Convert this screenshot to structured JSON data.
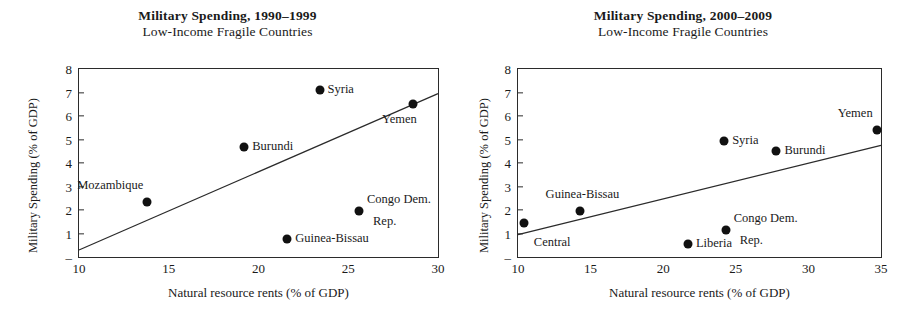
{
  "figure": {
    "panels": [
      "left",
      "right"
    ]
  },
  "chart_data": [
    {
      "id": "military-spending-1990-1999",
      "type": "scatter",
      "title": "Military Spending, 1990–1999",
      "subtitle": "Low-Income Fragile Countries",
      "xlabel": "Natural resource rents (% of GDP)",
      "ylabel": "Military Spending (% of GDP)",
      "xlim": [
        10,
        30
      ],
      "ylim": [
        0,
        8
      ],
      "xticks": [
        "10",
        "15",
        "20",
        "25",
        "30"
      ],
      "xtick_values": [
        10,
        15,
        20,
        25,
        30
      ],
      "yticks": [
        "–",
        "1",
        "2",
        "3",
        "4",
        "5",
        "6",
        "7",
        "8"
      ],
      "ytick_values": [
        0,
        1,
        2,
        3,
        4,
        5,
        6,
        7,
        8
      ],
      "grid": false,
      "legend": "none",
      "marker_color": "#111111",
      "frame_color": "#2b2b2b",
      "points": [
        {
          "label": "Mozambique",
          "x": 13.8,
          "y": 2.35,
          "label_pos": "above-left"
        },
        {
          "label": "Burundi",
          "x": 19.2,
          "y": 4.7,
          "label_pos": "right"
        },
        {
          "label": "Syria",
          "x": 23.4,
          "y": 7.1,
          "label_pos": "right"
        },
        {
          "label": "Yemen",
          "x": 28.6,
          "y": 6.5,
          "label_pos": "below-left"
        },
        {
          "label": "Congo Dem.\nRep.",
          "x": 25.6,
          "y": 1.95,
          "label_pos": "right-two-line"
        },
        {
          "label": "Guinea-Bissau",
          "x": 21.6,
          "y": 0.75,
          "label_pos": "right"
        }
      ],
      "trendline": {
        "x1": 10.0,
        "y1": 0.3,
        "x2": 30.0,
        "y2": 6.95
      }
    },
    {
      "id": "military-spending-2000-2009",
      "type": "scatter",
      "title": "Military Spending, 2000–2009",
      "subtitle": "Low-Income Fragile Countries",
      "xlabel": "Natural resource rents (% of GDP)",
      "ylabel": "Military Spending (% of GDP)",
      "xlim": [
        10,
        35
      ],
      "ylim": [
        0,
        8
      ],
      "xticks": [
        "10",
        "15",
        "20",
        "25",
        "30",
        "35"
      ],
      "xtick_values": [
        10,
        15,
        20,
        25,
        30,
        35
      ],
      "yticks": [
        "–",
        "1",
        "2",
        "3",
        "4",
        "5",
        "6",
        "7",
        "8"
      ],
      "ytick_values": [
        0,
        1,
        2,
        3,
        4,
        5,
        6,
        7,
        8
      ],
      "grid": false,
      "legend": "none",
      "marker_color": "#111111",
      "frame_color": "#2b2b2b",
      "points": [
        {
          "label": "Central",
          "x": 10.4,
          "y": 1.45,
          "label_pos": "below-right"
        },
        {
          "label": "Guinea-Bissau",
          "x": 14.3,
          "y": 1.95,
          "label_pos": "above"
        },
        {
          "label": "Liberia",
          "x": 21.7,
          "y": 0.55,
          "label_pos": "right"
        },
        {
          "label": "Congo Dem.\nRep.",
          "x": 24.3,
          "y": 1.15,
          "label_pos": "right-two-line"
        },
        {
          "label": "Syria",
          "x": 24.2,
          "y": 4.95,
          "label_pos": "right"
        },
        {
          "label": "Burundi",
          "x": 27.8,
          "y": 4.5,
          "label_pos": "right"
        },
        {
          "label": "Yemen",
          "x": 34.7,
          "y": 5.4,
          "label_pos": "above-left"
        }
      ],
      "trendline": {
        "x1": 10.0,
        "y1": 0.95,
        "x2": 35.0,
        "y2": 4.75
      }
    }
  ],
  "left": {
    "title": "Military Spending, 1990–1999",
    "subtitle": "Low-Income Fragile Countries",
    "xlabel": "Natural resource rents (% of GDP)",
    "ylabel": "Military Spending (% of GDP)",
    "xticks": [
      "10",
      "15",
      "20",
      "25",
      "30"
    ],
    "yticks": [
      "8",
      "7",
      "6",
      "5",
      "4",
      "3",
      "2",
      "1",
      "–"
    ],
    "labels": {
      "mozambique": "Mozambique",
      "burundi": "Burundi",
      "syria": "Syria",
      "yemen": "Yemen",
      "congo1": "Congo Dem.",
      "congo2": "Rep.",
      "guinea": "Guinea-Bissau"
    }
  },
  "right": {
    "title": "Military Spending, 2000–2009",
    "subtitle": "Low-Income Fragile Countries",
    "xlabel": "Natural resource rents (% of GDP)",
    "ylabel": "Military Spending (% of GDP)",
    "xticks": [
      "10",
      "15",
      "20",
      "25",
      "30",
      "35"
    ],
    "yticks": [
      "8",
      "7",
      "6",
      "5",
      "4",
      "3",
      "2",
      "1",
      "–"
    ],
    "labels": {
      "central": "Central",
      "guinea": "Guinea-Bissau",
      "liberia": "Liberia",
      "congo1": "Congo Dem.",
      "congo2": "Rep.",
      "syria": "Syria",
      "burundi": "Burundi",
      "yemen": "Yemen"
    }
  }
}
